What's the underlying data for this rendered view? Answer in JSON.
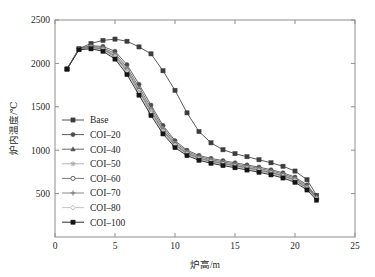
{
  "chart_data": {
    "type": "line",
    "title": "",
    "xlabel": "炉高/m",
    "ylabel": "炉内温度/℃",
    "xlim": [
      0,
      25
    ],
    "ylim": [
      0,
      2500
    ],
    "xticks": [
      0,
      5,
      10,
      15,
      20,
      25
    ],
    "yticks": [
      500,
      1000,
      1500,
      2000,
      2500
    ],
    "xtick_labels": [
      "0",
      "5",
      "10",
      "15",
      "20",
      "25"
    ],
    "ytick_labels": [
      "500",
      "1000",
      "1500",
      "2000",
      "2500"
    ],
    "grid": false,
    "legend_position": "center-left",
    "series": [
      {
        "name": "Base",
        "marker": "square",
        "color": "#3c3c3c",
        "x": [
          1.0,
          2.0,
          3.0,
          4.0,
          5.0,
          6.0,
          7.0,
          8.0,
          9.0,
          10.0,
          11.0,
          12.0,
          13.0,
          14.0,
          15.0,
          16.0,
          17.0,
          18.0,
          19.0,
          20.0,
          21.0,
          21.8
        ],
        "y": [
          1935,
          2170,
          2230,
          2265,
          2280,
          2255,
          2190,
          2110,
          1915,
          1690,
          1430,
          1215,
          1085,
          1005,
          960,
          925,
          890,
          855,
          815,
          760,
          660,
          480
        ]
      },
      {
        "name": "COI–20",
        "marker": "circle",
        "color": "#4a4a4a",
        "x": [
          1.0,
          2.0,
          3.0,
          4.0,
          5.0,
          6.0,
          7.0,
          8.0,
          9.0,
          10.0,
          11.0,
          12.0,
          13.0,
          14.0,
          15.0,
          16.0,
          17.0,
          18.0,
          19.0,
          20.0,
          21.0,
          21.8
        ],
        "y": [
          1935,
          2170,
          2205,
          2195,
          2140,
          1985,
          1760,
          1520,
          1285,
          1110,
          1000,
          940,
          905,
          880,
          855,
          830,
          805,
          775,
          740,
          690,
          600,
          465
        ]
      },
      {
        "name": "COI–40",
        "marker": "triangle",
        "color": "#565656",
        "x": [
          1.0,
          2.0,
          3.0,
          4.0,
          5.0,
          6.0,
          7.0,
          8.0,
          9.0,
          10.0,
          11.0,
          12.0,
          13.0,
          14.0,
          15.0,
          16.0,
          17.0,
          18.0,
          19.0,
          20.0,
          21.0,
          21.8
        ],
        "y": [
          1935,
          2168,
          2195,
          2180,
          2115,
          1955,
          1725,
          1490,
          1260,
          1090,
          985,
          925,
          890,
          865,
          840,
          815,
          790,
          760,
          725,
          675,
          585,
          455
        ]
      },
      {
        "name": "COI–50",
        "marker": "star",
        "color": "#aaaaaa",
        "x": [
          1.0,
          2.0,
          3.0,
          4.0,
          5.0,
          6.0,
          7.0,
          8.0,
          9.0,
          10.0,
          11.0,
          12.0,
          13.0,
          14.0,
          15.0,
          16.0,
          17.0,
          18.0,
          19.0,
          20.0,
          21.0,
          21.8
        ],
        "y": [
          1935,
          2166,
          2190,
          2172,
          2100,
          1938,
          1705,
          1470,
          1245,
          1078,
          975,
          917,
          882,
          856,
          831,
          806,
          781,
          751,
          716,
          666,
          576,
          450
        ]
      },
      {
        "name": "COI–60",
        "marker": "circle-open",
        "color": "#6a6a6a",
        "x": [
          1.0,
          2.0,
          3.0,
          4.0,
          5.0,
          6.0,
          7.0,
          8.0,
          9.0,
          10.0,
          11.0,
          12.0,
          13.0,
          14.0,
          15.0,
          16.0,
          17.0,
          18.0,
          19.0,
          20.0,
          21.0,
          21.8
        ],
        "y": [
          1935,
          2164,
          2185,
          2165,
          2088,
          1922,
          1688,
          1452,
          1230,
          1066,
          966,
          909,
          874,
          848,
          823,
          798,
          772,
          742,
          707,
          657,
          568,
          445
        ]
      },
      {
        "name": "COI–70",
        "marker": "plus",
        "color": "#7a7a7a",
        "x": [
          1.0,
          2.0,
          3.0,
          4.0,
          5.0,
          6.0,
          7.0,
          8.0,
          9.0,
          10.0,
          11.0,
          12.0,
          13.0,
          14.0,
          15.0,
          16.0,
          17.0,
          18.0,
          19.0,
          20.0,
          21.0,
          21.8
        ],
        "y": [
          1935,
          2162,
          2180,
          2158,
          2076,
          1906,
          1671,
          1435,
          1216,
          1054,
          957,
          901,
          866,
          840,
          815,
          790,
          764,
          734,
          699,
          649,
          560,
          440
        ]
      },
      {
        "name": "COI–80",
        "marker": "diamond-open",
        "color": "#c0c0c0",
        "x": [
          1.0,
          2.0,
          3.0,
          4.0,
          5.0,
          6.0,
          7.0,
          8.0,
          9.0,
          10.0,
          11.0,
          12.0,
          13.0,
          14.0,
          15.0,
          16.0,
          17.0,
          18.0,
          19.0,
          20.0,
          21.0,
          21.8
        ],
        "y": [
          1935,
          2160,
          2175,
          2150,
          2064,
          1890,
          1654,
          1418,
          1202,
          1042,
          948,
          893,
          858,
          832,
          807,
          782,
          756,
          726,
          691,
          641,
          552,
          435
        ]
      },
      {
        "name": "COI–100",
        "marker": "square",
        "color": "#141414",
        "x": [
          1.0,
          2.0,
          3.0,
          4.0,
          5.0,
          6.0,
          7.0,
          8.0,
          9.0,
          10.0,
          11.0,
          12.0,
          13.0,
          14.0,
          15.0,
          16.0,
          17.0,
          18.0,
          19.0,
          20.0,
          21.0,
          21.8
        ],
        "y": [
          1935,
          2158,
          2168,
          2140,
          2050,
          1872,
          1635,
          1400,
          1188,
          1030,
          938,
          884,
          849,
          823,
          798,
          772,
          746,
          716,
          680,
          630,
          542,
          425
        ]
      }
    ]
  }
}
